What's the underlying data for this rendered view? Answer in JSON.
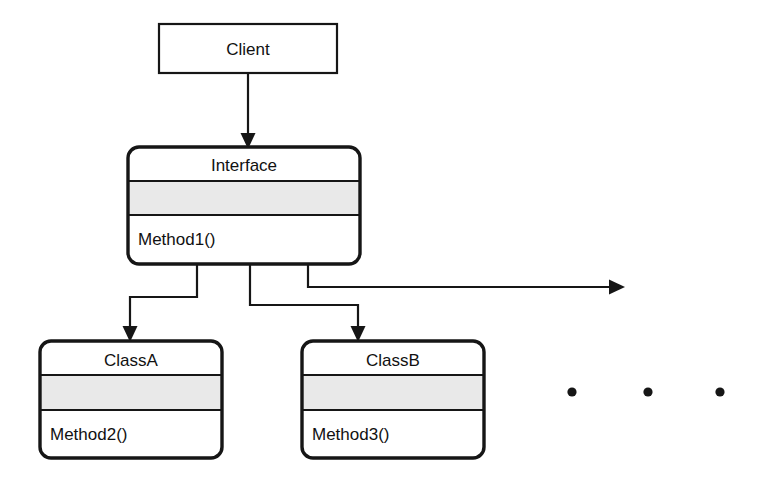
{
  "diagram": {
    "background_color": "#ffffff",
    "line_color": "#161616",
    "compartment_fill_color": "#e9e9e9",
    "box_fill_color": "#ffffff"
  },
  "nodes": {
    "client": {
      "name": "Client",
      "shape": "rectangle",
      "corner": "square"
    },
    "interface": {
      "name": "Interface",
      "shape": "rounded-rectangle",
      "attributes_compartment": "",
      "methods": [
        "Method1()"
      ]
    },
    "class_a": {
      "name": "ClassA",
      "shape": "rounded-rectangle",
      "attributes_compartment": "",
      "methods": [
        "Method2()"
      ]
    },
    "class_b": {
      "name": "ClassB",
      "shape": "rounded-rectangle",
      "attributes_compartment": "",
      "methods": [
        "Method3()"
      ]
    }
  },
  "connectors": [
    {
      "id": "client-to-interface",
      "from": "client",
      "to": "interface",
      "style": "solid",
      "arrow": "filled-triangle",
      "label": ""
    },
    {
      "id": "interface-to-class-a",
      "from": "interface",
      "to": "class_a",
      "style": "solid-elbow",
      "arrow": "filled-triangle",
      "label": ""
    },
    {
      "id": "interface-to-class-b",
      "from": "interface",
      "to": "class_b",
      "style": "solid-elbow",
      "arrow": "filled-triangle",
      "label": ""
    },
    {
      "id": "interface-to-more",
      "from": "interface",
      "to": "ellipsis",
      "style": "solid-elbow",
      "arrow": "filled-triangle",
      "label": ""
    }
  ],
  "ellipsis": {
    "label": "",
    "dot_count": 3,
    "meaning": "more implementing classes"
  }
}
